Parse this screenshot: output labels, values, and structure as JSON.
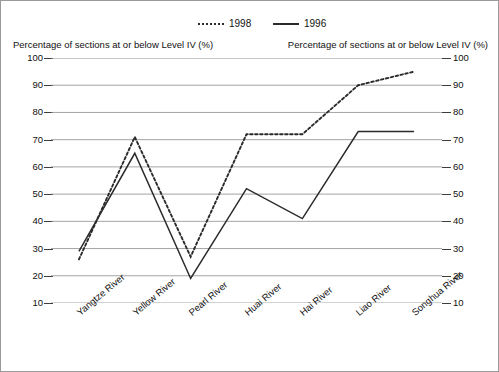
{
  "figure": {
    "top_faint_text": "",
    "left_axis_caption": "Percentage of sections at or below Level IV (%)",
    "right_axis_caption": "Percentage of sections at or below Level IV (%)"
  },
  "legend": {
    "items": [
      {
        "label": "1998",
        "style": "dashed",
        "color": "#2b2b2b"
      },
      {
        "label": "1996",
        "style": "solid",
        "color": "#2b2b2b"
      }
    ]
  },
  "chart_data": {
    "type": "line",
    "title": "",
    "xlabel": "",
    "ylabel": "Percentage of sections at or below Level IV (%)",
    "ylim": [
      10,
      100
    ],
    "yticks": [
      100,
      90,
      80,
      70,
      60,
      50,
      40,
      30,
      20,
      10
    ],
    "grid": true,
    "dual_axis": true,
    "legend_position": "top-center",
    "categories": [
      "Yangtze River",
      "Yellow River",
      "Pearl River",
      "Huai River",
      "Hai River",
      "Liao River",
      "Songhua River"
    ],
    "series": [
      {
        "name": "1998",
        "style": "dashed",
        "color": "#2b2b2b",
        "values": [
          26,
          71,
          27,
          72,
          72,
          90,
          95
        ]
      },
      {
        "name": "1996",
        "style": "solid",
        "color": "#2b2b2b",
        "values": [
          29,
          65,
          19,
          52,
          41,
          73,
          73
        ]
      }
    ]
  }
}
